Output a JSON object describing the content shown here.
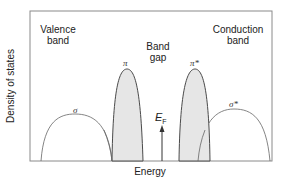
{
  "diagram": {
    "type": "band-structure-density-of-states",
    "axes": {
      "xlabel": "Energy",
      "ylabel": "Density of states"
    },
    "regions": {
      "valence": [
        "Valence",
        "band"
      ],
      "gap": [
        "Band",
        "gap"
      ],
      "conduction": [
        "Conduction",
        "band"
      ]
    },
    "bands": [
      {
        "id": "sigma",
        "label": "σ",
        "filled": false
      },
      {
        "id": "pi",
        "label": "π",
        "filled": true
      },
      {
        "id": "pi_star",
        "label": "π*",
        "filled": true
      },
      {
        "id": "sigma_star",
        "label": "σ*",
        "filled": false
      }
    ],
    "fermi_level": {
      "label": "E",
      "subscript": "F"
    },
    "colors": {
      "frame": "#8a8a8a",
      "curve": "#555555",
      "fill": "#e6e6e6"
    }
  }
}
